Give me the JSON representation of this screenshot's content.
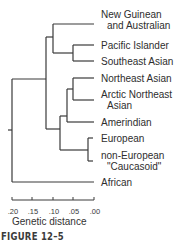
{
  "figure": {
    "caption": "FIGURE 12–5",
    "line_color": "#3a3a3a"
  },
  "tree": {
    "leaves": [
      {
        "id": "new-guinean",
        "line1": "New Guinean",
        "line2": "and Australian"
      },
      {
        "id": "pacific-islander",
        "line1": "Pacific Islander",
        "line2": ""
      },
      {
        "id": "southeast-asian",
        "line1": "Southeast Asian",
        "line2": ""
      },
      {
        "id": "northeast-asian",
        "line1": "Northeast Asian",
        "line2": ""
      },
      {
        "id": "arctic-northeast-asian",
        "line1": "Arctic Northeast",
        "line2": "Asian"
      },
      {
        "id": "amerindian",
        "line1": "Amerindian",
        "line2": ""
      },
      {
        "id": "european",
        "line1": "European",
        "line2": ""
      },
      {
        "id": "non-european-caucasoid",
        "line1": "non-European",
        "line2": "\"Caucasoid\""
      },
      {
        "id": "african",
        "line1": "African",
        "line2": ""
      }
    ]
  },
  "axis": {
    "title": "Genetic distance",
    "ticks": [
      ".20",
      ".15",
      ".10",
      ".05",
      ".00"
    ]
  }
}
